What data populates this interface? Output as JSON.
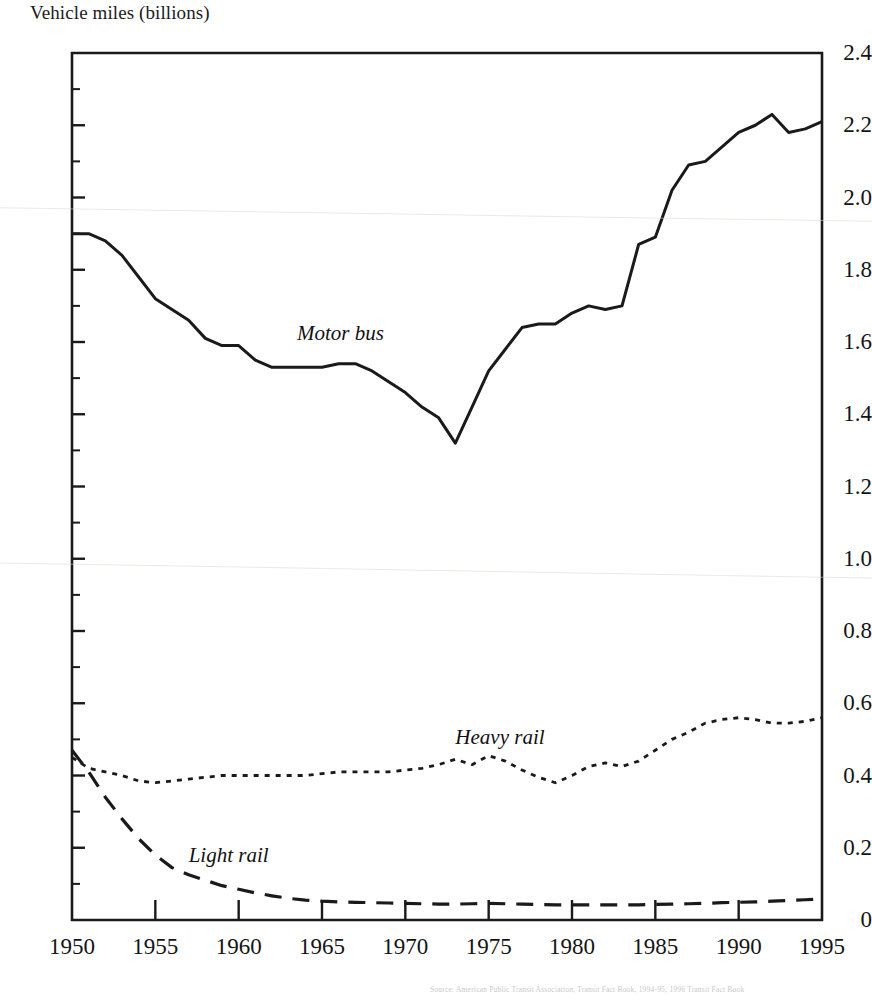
{
  "chart_data": {
    "type": "line",
    "title": "Vehicle miles (billions)",
    "xlabel": "",
    "ylabel": "Vehicle miles (billions)",
    "xlim": [
      1950,
      1995
    ],
    "ylim": [
      0,
      2.4
    ],
    "grid": false,
    "legend_position": "inline-annotations",
    "ytick_labels": [
      "2.4",
      "2.2",
      "2.0",
      "1.8",
      "1.6",
      "1.4",
      "1.2",
      "1.0",
      "0.8",
      "0.6",
      "0.4",
      "0.2",
      "0"
    ],
    "ytick_values": [
      2.4,
      2.2,
      2.0,
      1.8,
      1.6,
      1.4,
      1.2,
      1.0,
      0.8,
      0.6,
      0.4,
      0.2,
      0
    ],
    "yminor_step": 0.1,
    "xtick_labels": [
      "1950",
      "1955",
      "1960",
      "1965",
      "1970",
      "1975",
      "1980",
      "1985",
      "1990",
      "1995"
    ],
    "xtick_values": [
      1950,
      1955,
      1960,
      1965,
      1970,
      1975,
      1980,
      1985,
      1990,
      1995
    ],
    "x": [
      1950,
      1951,
      1952,
      1953,
      1954,
      1955,
      1956,
      1957,
      1958,
      1959,
      1960,
      1961,
      1962,
      1963,
      1964,
      1965,
      1966,
      1967,
      1968,
      1969,
      1970,
      1971,
      1972,
      1973,
      1974,
      1975,
      1976,
      1977,
      1978,
      1979,
      1980,
      1981,
      1982,
      1983,
      1984,
      1985,
      1986,
      1987,
      1988,
      1989,
      1990,
      1991,
      1992,
      1993,
      1994,
      1995
    ],
    "series": [
      {
        "name": "Motor bus",
        "style": "solid",
        "color": "#1a1a1a",
        "label_x": 1963.5,
        "label_y": 1.62,
        "values": [
          1.9,
          1.9,
          1.88,
          1.84,
          1.78,
          1.72,
          1.69,
          1.66,
          1.61,
          1.59,
          1.59,
          1.55,
          1.53,
          1.53,
          1.53,
          1.53,
          1.54,
          1.54,
          1.52,
          1.49,
          1.46,
          1.42,
          1.39,
          1.32,
          1.42,
          1.52,
          1.58,
          1.64,
          1.65,
          1.65,
          1.68,
          1.7,
          1.69,
          1.7,
          1.87,
          1.89,
          2.02,
          2.09,
          2.1,
          2.14,
          2.18,
          2.2,
          2.23,
          2.18,
          2.19,
          2.21
        ]
      },
      {
        "name": "Heavy rail",
        "style": "dotted",
        "color": "#1a1a1a",
        "label_x": 1973.0,
        "label_y": 0.5,
        "values": [
          0.45,
          0.42,
          0.41,
          0.4,
          0.385,
          0.38,
          0.385,
          0.39,
          0.395,
          0.4,
          0.4,
          0.4,
          0.4,
          0.4,
          0.4,
          0.405,
          0.41,
          0.41,
          0.41,
          0.41,
          0.415,
          0.42,
          0.43,
          0.445,
          0.43,
          0.455,
          0.44,
          0.415,
          0.395,
          0.38,
          0.4,
          0.425,
          0.435,
          0.425,
          0.44,
          0.47,
          0.5,
          0.52,
          0.545,
          0.555,
          0.56,
          0.555,
          0.545,
          0.545,
          0.55,
          0.56
        ]
      },
      {
        "name": "Light rail",
        "style": "dashed",
        "color": "#1a1a1a",
        "label_x": 1957.0,
        "label_y": 0.175,
        "values": [
          0.47,
          0.41,
          0.34,
          0.28,
          0.225,
          0.18,
          0.145,
          0.125,
          0.11,
          0.095,
          0.085,
          0.075,
          0.067,
          0.06,
          0.055,
          0.052,
          0.05,
          0.049,
          0.048,
          0.047,
          0.046,
          0.045,
          0.044,
          0.044,
          0.045,
          0.046,
          0.045,
          0.044,
          0.043,
          0.042,
          0.042,
          0.042,
          0.042,
          0.042,
          0.042,
          0.043,
          0.044,
          0.045,
          0.046,
          0.048,
          0.049,
          0.05,
          0.052,
          0.054,
          0.056,
          0.058
        ]
      }
    ],
    "footnote": "Source: American Public Transit Association, Transit Fact Book, 1994-95; 1996 Transit Fact Book"
  }
}
